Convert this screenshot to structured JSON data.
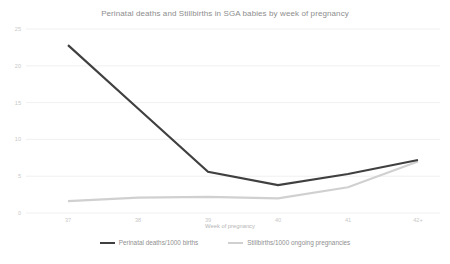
{
  "chart_data": {
    "type": "line",
    "title": "Perinatal deaths and Stillbirths in SGA babies by week of pregnancy",
    "xlabel": "Week of pregnancy",
    "ylabel": "",
    "categories": [
      "37",
      "38",
      "39",
      "40",
      "41",
      "42+"
    ],
    "xtick_labels": [
      "37",
      "38",
      "39",
      "40",
      "41",
      "42+"
    ],
    "ytick_labels": [
      "0",
      "5",
      "10",
      "15",
      "20",
      "25"
    ],
    "yticks": [
      0,
      5,
      10,
      15,
      20,
      25
    ],
    "ylim": [
      0,
      25
    ],
    "grid": "horizontal",
    "legend_position": "bottom",
    "series": [
      {
        "name": "Perinatal deaths/1000 births",
        "color": "#404040",
        "values": [
          22.8,
          14.2,
          5.6,
          3.8,
          5.3,
          7.2
        ]
      },
      {
        "name": "Stillbirths/1000 ongoing pregnancies",
        "color": "#d0d0d0",
        "values": [
          1.6,
          2.1,
          2.2,
          2.0,
          3.5,
          7.0
        ]
      }
    ]
  },
  "legend": {
    "items": [
      {
        "label": "Perinatal deaths/1000 births",
        "color": "#404040"
      },
      {
        "label": "Stillbirths/1000 ongoing pregnancies",
        "color": "#d0d0d0"
      }
    ]
  },
  "colors": {
    "background": "#ffffff",
    "grid": "#ececec",
    "tick_text": "#c8c8c8",
    "title_text": "#8d8d8d",
    "series_dark": "#404040",
    "series_light": "#d0d0d0"
  }
}
